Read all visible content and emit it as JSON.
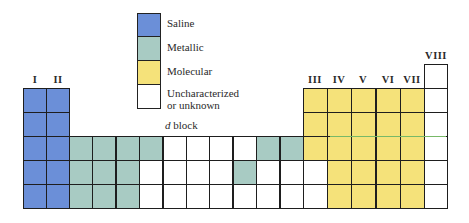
{
  "legend": [
    {
      "key": "S",
      "label": "Saline",
      "color": "#6b8fd8"
    },
    {
      "key": "M",
      "label": "Metallic",
      "color": "#a8cbc3"
    },
    {
      "key": "Y",
      "label": "Molecular",
      "color": "#f5e27a"
    },
    {
      "key": "W",
      "label_line1": "Uncharacterized",
      "label_line2": "or unknown",
      "color": "#ffffff"
    }
  ],
  "group_labels": {
    "I": "I",
    "II": "II",
    "III": "III",
    "IV": "IV",
    "V": "V",
    "VI": "VI",
    "VII": "VII",
    "VIII": "VIII"
  },
  "dblock_label_italic": "d",
  "dblock_label_rest": " block",
  "colors": {
    "S": "#6b8fd8",
    "M": "#a8cbc3",
    "Y": "#f5e27a",
    "W": "#ffffff"
  },
  "table": {
    "s_block": {
      "columns": [
        "I",
        "II"
      ],
      "rows": [
        [
          "S",
          "S"
        ],
        [
          "S",
          "S"
        ],
        [
          "S",
          "S"
        ],
        [
          "S",
          "S"
        ],
        [
          "S",
          "S"
        ]
      ]
    },
    "d_block": {
      "rows": [
        [
          "M",
          "M",
          "M",
          "M",
          "W",
          "W",
          "W",
          "W",
          "M",
          "M"
        ],
        [
          "M",
          "M",
          "M",
          "W",
          "W",
          "W",
          "W",
          "M",
          "W",
          "W"
        ],
        [
          "M",
          "M",
          "M",
          "W",
          "W",
          "W",
          "W",
          "W",
          "W",
          "W"
        ]
      ]
    },
    "p_block": {
      "columns": [
        "III",
        "IV",
        "V",
        "VI",
        "VII"
      ],
      "rows": [
        [
          "Y",
          "Y",
          "Y",
          "Y",
          "Y"
        ],
        [
          "Y",
          "Y",
          "Y",
          "Y",
          "Y"
        ],
        [
          "Y",
          "Y",
          "Y",
          "Y",
          "Y"
        ],
        [
          "W",
          "Y",
          "Y",
          "Y",
          "Y"
        ],
        [
          "W",
          "Y",
          "Y",
          "Y",
          "Y"
        ]
      ]
    },
    "group_viii": {
      "rows": [
        "W",
        "W",
        "W",
        "W",
        "W",
        "W"
      ]
    }
  }
}
